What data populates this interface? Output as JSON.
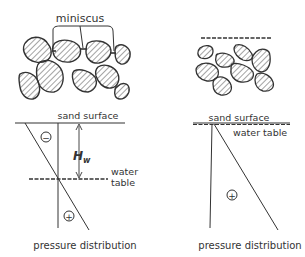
{
  "left_panel": {
    "meniscus_label": "miniscus",
    "sand_surface_label": "sand surface",
    "height_label": "H",
    "height_subscript": "w",
    "water_label_line1": "water",
    "water_label_line2": "table",
    "negative_sign": "−",
    "positive_sign": "+",
    "caption": "pressure distribution"
  },
  "right_panel": {
    "sand_surface_label": "sand surface",
    "water_table_label": "water table",
    "positive_sign": "+",
    "caption": "pressure distribution"
  },
  "colors": {
    "ink": "#333333",
    "hatch": "#555555",
    "background": "#ffffff"
  }
}
